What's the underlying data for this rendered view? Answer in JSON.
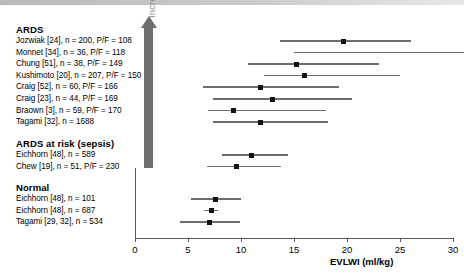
{
  "axis": {
    "x_label": "EVLWI (ml/kg)",
    "ticks": [
      0,
      5,
      10,
      15,
      20,
      25,
      30
    ]
  },
  "severity_arrow": {
    "label": "Increasing Severity of Lung Injury"
  },
  "groups": [
    {
      "heading": "ARDS",
      "rows": [
        "Jozwiak [24], n = 200, P/F = 108",
        "Monnet [34], n = 36, P/F = 118",
        "Chung [51], n = 38, P/F = 149",
        "Kushimoto [20], n = 207, P/F = 150",
        "Craig [52], n = 60, P/F = 166",
        "Craig [23], n = 44, P/F = 169",
        "Braown [3], n = 59, P/F = 170",
        "Tagami [32], n = 1688"
      ]
    },
    {
      "heading": "ARDS at risk (sepsis)",
      "rows": [
        "Eichhorn [48], n = 589",
        "Chew [19], n = 51, P/F = 230"
      ]
    },
    {
      "heading": "Normal",
      "rows": [
        "Eichhorn [48], n = 101",
        "Eichhorn [48], n = 687",
        "Tagami [29, 32], n = 534"
      ]
    }
  ],
  "chart_data": {
    "type": "scatter",
    "title": "",
    "xlabel": "EVLWI (ml/kg)",
    "ylabel": "Increasing Severity of Lung Injury",
    "xlim": [
      0,
      31.8
    ],
    "grid": false,
    "legend": "none",
    "series": [
      {
        "name": "Jozwiak [24], n = 200, P/F = 108",
        "group": "ARDS",
        "value": 19.7,
        "low": 13.7,
        "high": 26.0,
        "marker": true
      },
      {
        "name": "Monnet [34], n = 36, P/F = 118",
        "group": "ARDS",
        "value": null,
        "low": 15.0,
        "high": 31.0,
        "marker": false
      },
      {
        "name": "Chung [51], n = 38, P/F = 149",
        "group": "ARDS",
        "value": 15.2,
        "low": 10.7,
        "high": 23.0,
        "marker": true
      },
      {
        "name": "Kushimoto [20], n = 207, P/F = 150",
        "group": "ARDS",
        "value": 16.0,
        "low": 12.2,
        "high": 25.0,
        "marker": true
      },
      {
        "name": "Craig [52], n = 60, P/F = 166",
        "group": "ARDS",
        "value": 11.8,
        "low": 6.4,
        "high": 19.2,
        "marker": true
      },
      {
        "name": "Craig [23], n = 44, P/F = 169",
        "group": "ARDS",
        "value": 13.0,
        "low": 7.4,
        "high": 20.5,
        "marker": true
      },
      {
        "name": "Braown [3], n = 59, P/F = 170",
        "group": "ARDS",
        "value": 9.3,
        "low": 6.9,
        "high": 18.0,
        "marker": true
      },
      {
        "name": "Tagami [32], n = 1688",
        "group": "ARDS",
        "value": 11.8,
        "low": 7.4,
        "high": 18.2,
        "marker": true
      },
      {
        "name": "Eichhorn [48], n = 589",
        "group": "ARDS at risk (sepsis)",
        "value": 11.0,
        "low": 8.2,
        "high": 14.4,
        "marker": true
      },
      {
        "name": "Chew [19], n = 51, P/F = 230",
        "group": "ARDS at risk (sepsis)",
        "value": 9.6,
        "low": 6.8,
        "high": 13.8,
        "marker": true
      },
      {
        "name": "Eichhorn [48], n = 101",
        "group": "Normal",
        "value": 7.6,
        "low": 5.3,
        "high": 10.0,
        "marker": true
      },
      {
        "name": "Eichhorn [48], n = 687",
        "group": "Normal",
        "value": 7.2,
        "low": 6.5,
        "high": 7.8,
        "marker": true
      },
      {
        "name": "Tagami [29, 32], n = 534",
        "group": "Normal",
        "value": 7.0,
        "low": 4.2,
        "high": 9.9,
        "marker": true
      }
    ]
  }
}
